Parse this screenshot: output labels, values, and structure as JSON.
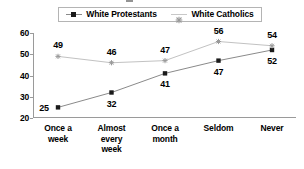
{
  "chart_data": {
    "type": "line",
    "title": "",
    "xlabel": "",
    "ylabel": "",
    "categories": [
      "Once a week",
      "Almost every week",
      "Once a month",
      "Seldom",
      "Never"
    ],
    "series": [
      {
        "name": "White Protestants",
        "values": [
          25,
          32,
          41,
          47,
          52
        ],
        "marker": "filled-square",
        "color": "#1a1a1a",
        "line_color": "#8a8a8a",
        "label_positions": [
          "left",
          "below",
          "below",
          "below",
          "below"
        ]
      },
      {
        "name": "White Catholics",
        "values": [
          49,
          46,
          47,
          56,
          54
        ],
        "marker": "star",
        "color": "#9a9a9a",
        "line_color": "#c2c2c2",
        "label_positions": [
          "above",
          "above",
          "above",
          "above",
          "above"
        ]
      }
    ],
    "ylim": [
      20,
      60
    ],
    "yticks": [
      20,
      30,
      40,
      50,
      60
    ],
    "ytick_labels": [
      "20",
      "30",
      "40",
      "50",
      "60"
    ],
    "grid": false,
    "legend_position": "top",
    "axis_color": "#9a9a9a",
    "background": "#ffffff"
  },
  "legend": {
    "entries": [
      {
        "label": "White Protestants",
        "marker": "square-marker-icon"
      },
      {
        "label": "White Catholics",
        "marker": "star-marker-icon"
      }
    ]
  },
  "value_labels": {
    "protestants": [
      "25",
      "32",
      "41",
      "47",
      "52"
    ],
    "catholics": [
      "49",
      "46",
      "47",
      "56",
      "54"
    ]
  }
}
